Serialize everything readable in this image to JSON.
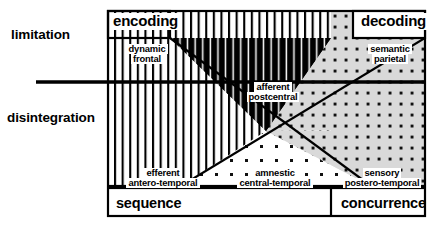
{
  "figure": {
    "kind": "conceptual-matrix-diagram",
    "axis_labels": {
      "upper_left": "limitation",
      "lower_left": "disintegration"
    },
    "column_headers": {
      "left": "encoding",
      "right": "decoding"
    },
    "bottom_bar": {
      "left": "sequence",
      "right": "concurrence"
    },
    "regions": [
      {
        "id": "dynamic-frontal",
        "line1": "dynamic",
        "line2": "frontal",
        "fill": "vertical-stripes",
        "quadrant": "upper-left"
      },
      {
        "id": "semantic-parietal",
        "line1": "semantic",
        "line2": "parietal",
        "fill": "dot-grid",
        "quadrant": "upper-right"
      },
      {
        "id": "afferent-postcentral",
        "line1": "afferent",
        "line2": "postcentral",
        "fill": "dense-black-stripes",
        "quadrant": "upper-center"
      },
      {
        "id": "efferent-antero-temporal",
        "line1": "efferent",
        "line2": "antero-temporal",
        "fill": "vertical-stripes",
        "quadrant": "lower-left"
      },
      {
        "id": "amnestic-central-temporal",
        "line1": "amnestic",
        "line2": "central-temporal",
        "fill": "sparse-dots-white",
        "quadrant": "lower-center"
      },
      {
        "id": "sensory-postero-temporal",
        "line1": "sensory",
        "line2": "postero-temporal",
        "fill": "dot-grid",
        "quadrant": "lower-right"
      }
    ],
    "colors": {
      "ink": "#000000",
      "paper": "#ffffff",
      "dot_field": "#d9d9d9",
      "stripe": "#000000"
    }
  }
}
